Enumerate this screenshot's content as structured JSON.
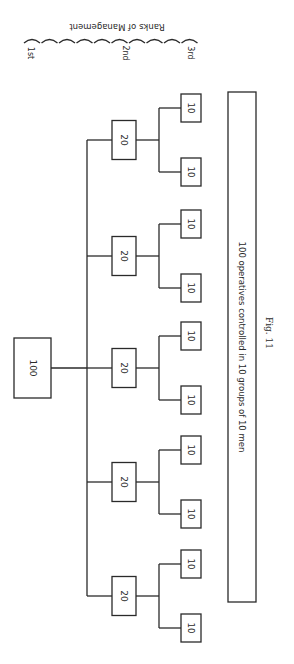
{
  "diagram": {
    "title": "Ranks of Management",
    "rank_labels": [
      "1st",
      "2nd",
      "3rd"
    ],
    "top": {
      "label": "100"
    },
    "groups": [
      {
        "label": "20",
        "children": [
          "10",
          "10"
        ]
      },
      {
        "label": "20",
        "children": [
          "10",
          "10"
        ]
      },
      {
        "label": "20",
        "children": [
          "10",
          "10"
        ]
      },
      {
        "label": "20",
        "children": [
          "10",
          "10"
        ]
      },
      {
        "label": "20",
        "children": [
          "10",
          "10"
        ]
      }
    ],
    "operatives_caption": "100 operatives controlled in 10 groups of 10 men",
    "figure_label": "Fig. 11"
  }
}
